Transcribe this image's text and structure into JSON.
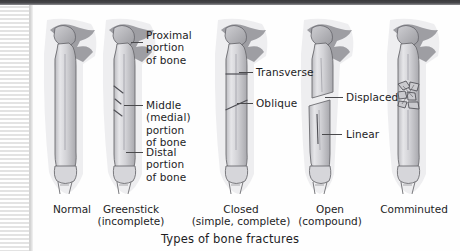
{
  "figure": {
    "caption": "Types of bone fractures",
    "specimens": [
      {
        "id": "normal",
        "name": "Normal",
        "label_line1": "Normal",
        "label_line2": "",
        "fracture": "none"
      },
      {
        "id": "greenstick",
        "name": "Greenstick",
        "label_line1": "Greenstick",
        "label_line2": "(incomplete)",
        "fracture": "greenstick"
      },
      {
        "id": "closed",
        "name": "Closed",
        "label_line1": "Closed",
        "label_line2": "(simple, complete)",
        "fracture": "closed"
      },
      {
        "id": "open",
        "name": "Open",
        "label_line1": "Open",
        "label_line2": "(compound)",
        "fracture": "open"
      },
      {
        "id": "comminuted",
        "name": "Comminuted",
        "label_line1": "Comminuted",
        "label_line2": "",
        "fracture": "comminuted"
      }
    ],
    "annotations": [
      {
        "id": "proximal",
        "text": "Proximal\nportion\nof bone"
      },
      {
        "id": "middle",
        "text": "Middle\n(medial)\nportion\nof bone"
      },
      {
        "id": "distal",
        "text": "Distal\nportion\nof bone"
      },
      {
        "id": "transverse",
        "text": "Transverse"
      },
      {
        "id": "oblique",
        "text": "Oblique"
      },
      {
        "id": "displaced",
        "text": "Displaced"
      },
      {
        "id": "linear",
        "text": "Linear"
      }
    ]
  },
  "colors": {
    "text": "#1d1d1f",
    "leader": "#4a4a4d",
    "bone_outline": "#6c6c70",
    "bone_fill": "#d9d9dc",
    "bone_shadow": "#a9a9ad",
    "tissue": "#ececee",
    "marrow": "#8d8d92",
    "page": "#fefefe",
    "top_bar": "#3a3a3c"
  }
}
